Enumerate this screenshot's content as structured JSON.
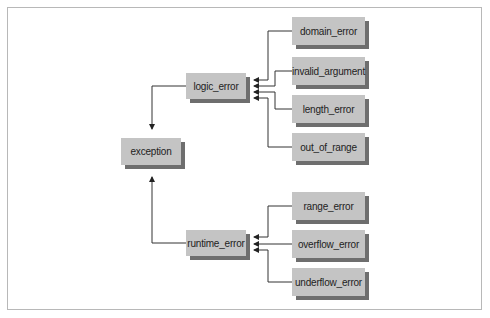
{
  "diagram": {
    "title": "",
    "nodes": {
      "exception": "exception",
      "logic_error": "logic_error",
      "runtime_error": "runtime_error",
      "domain_error": "domain_error",
      "invalid_argument": "invalid_argument",
      "length_error": "length_error",
      "out_of_range": "out_of_range",
      "range_error": "range_error",
      "overflow_error": "overflow_error",
      "underflow_error": "underflow_error"
    },
    "edges": [
      {
        "from": "logic_error",
        "to": "exception"
      },
      {
        "from": "runtime_error",
        "to": "exception"
      },
      {
        "from": "domain_error",
        "to": "logic_error"
      },
      {
        "from": "invalid_argument",
        "to": "logic_error"
      },
      {
        "from": "length_error",
        "to": "logic_error"
      },
      {
        "from": "out_of_range",
        "to": "logic_error"
      },
      {
        "from": "range_error",
        "to": "runtime_error"
      },
      {
        "from": "overflow_error",
        "to": "runtime_error"
      },
      {
        "from": "underflow_error",
        "to": "runtime_error"
      }
    ],
    "colors": {
      "box": "#c4c4c4",
      "shadow": "#6e6e6e",
      "line": "#333333",
      "frame": "#b8b8b8"
    }
  }
}
